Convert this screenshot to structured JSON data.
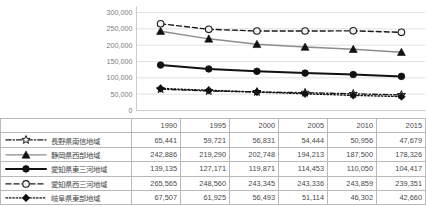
{
  "chart_data": {
    "type": "line",
    "title": "",
    "xlabel": "",
    "ylabel": "",
    "categories": [
      "1990",
      "1995",
      "2000",
      "2005",
      "2010",
      "2015"
    ],
    "ylim": [
      0,
      300000
    ],
    "ytick_labels": [
      "300,000",
      "250,000",
      "200,000",
      "150,000",
      "100,000",
      "50,000",
      "0"
    ],
    "ytick_values": [
      300000,
      250000,
      200000,
      150000,
      100000,
      50000,
      0
    ],
    "grid": true,
    "legend_position": "table-left",
    "series": [
      {
        "name": "長野県南信地域",
        "values": [
          65441,
          59721,
          56831,
          54444,
          50956,
          47679
        ],
        "display": [
          "65,441",
          "59,721",
          "56,831",
          "54,444",
          "50,956",
          "47,679"
        ],
        "marker": "open-star",
        "line_style": "dash-dot",
        "color": "#1a1a1a"
      },
      {
        "name": "静岡県西部地域",
        "values": [
          242886,
          219290,
          202748,
          194213,
          187500,
          178326
        ],
        "display": [
          "242,886",
          "219,290",
          "202,748",
          "194,213",
          "187,500",
          "178,326"
        ],
        "marker": "filled-triangle",
        "line_style": "solid",
        "color": "#8c8c8c"
      },
      {
        "name": "愛知県東三河地域",
        "values": [
          139135,
          127171,
          119871,
          114453,
          110050,
          104417
        ],
        "display": [
          "139,135",
          "127,171",
          "119,871",
          "114,453",
          "110,050",
          "104,417"
        ],
        "marker": "filled-circle",
        "line_style": "solid",
        "color": "#111111"
      },
      {
        "name": "愛知県西三河地域",
        "values": [
          265565,
          248560,
          243345,
          243336,
          243859,
          239351
        ],
        "display": [
          "265,565",
          "248,560",
          "243,345",
          "243,336",
          "243,859",
          "239,351"
        ],
        "marker": "open-circle",
        "line_style": "dashed",
        "color": "#1a1a1a"
      },
      {
        "name": "岐阜県東部地域",
        "values": [
          67507,
          61925,
          56493,
          51114,
          46302,
          42660
        ],
        "display": [
          "67,507",
          "61,925",
          "56,493",
          "51,114",
          "46,302",
          "42,660"
        ],
        "marker": "filled-diamond",
        "line_style": "dotted",
        "color": "#111111"
      }
    ]
  },
  "colors": {
    "grid": "#d9d9d9",
    "axis": "#bfbfbf",
    "table_border": "#b9b9b9",
    "text": "#4a4a4a",
    "tick_text": "#7b7b7b"
  }
}
